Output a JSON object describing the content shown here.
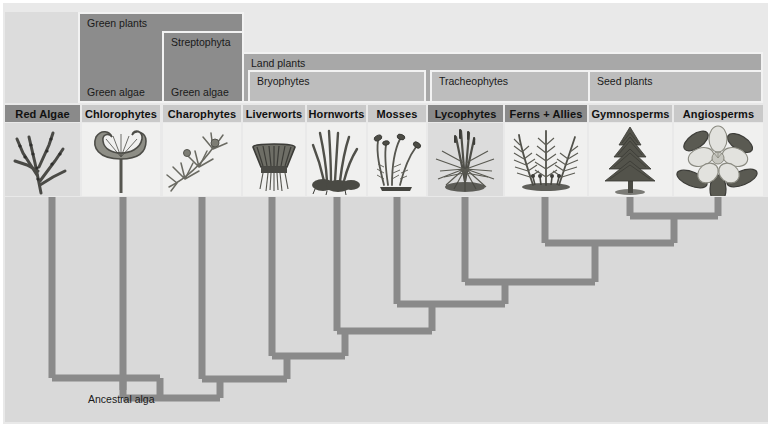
{
  "figure": {
    "type": "cladogram",
    "root_label": "Ancestral alga",
    "colors": {
      "page_background": "#ffffff",
      "panel_background": "#e9e9e9",
      "tree_background": "#d9d9d9",
      "branch": "#8a8a8a",
      "band_dark": "#8c8c8c",
      "band_mid": "#a8a8a8",
      "band_light": "#bdbdbd",
      "name_strip_dark": "#8a8a8a",
      "name_strip_light": "#c9c9c9",
      "text": "#1a1a1a"
    }
  },
  "clade_bands": [
    {
      "id": "green-plants",
      "label": "Green plants",
      "secondary_label": "Green algae",
      "x": 78,
      "y": 12,
      "width": 166,
      "height": 91,
      "shade": "band_dark"
    },
    {
      "id": "streptophyta",
      "label": "Streptophyta",
      "secondary_label": "Green algae",
      "x": 162,
      "y": 31,
      "width": 82,
      "height": 72,
      "shade": "band_dark"
    },
    {
      "id": "land-plants",
      "label": "Land plants",
      "secondary_label": "",
      "x": 242,
      "y": 52,
      "width": 521,
      "height": 51,
      "shade": "band_mid"
    },
    {
      "id": "bryophytes",
      "label": "Bryophytes",
      "secondary_label": "",
      "x": 248,
      "y": 70,
      "width": 178,
      "height": 33,
      "shade": "band_light"
    },
    {
      "id": "tracheophytes",
      "label": "Tracheophytes",
      "secondary_label": "",
      "x": 430,
      "y": 70,
      "width": 333,
      "height": 33,
      "shade": "band_light"
    },
    {
      "id": "seed-plants",
      "label": "Seed plants",
      "secondary_label": "",
      "x": 588,
      "y": 70,
      "width": 175,
      "height": 33,
      "shade": "band_light"
    }
  ],
  "taxa": [
    {
      "id": "red-algae",
      "label": "Red Algae",
      "x": 5,
      "width": 75,
      "tip_x": 52,
      "strip": "dark",
      "tint": true,
      "icon": "red-algae-icon"
    },
    {
      "id": "chlorophytes",
      "label": "Chlorophytes",
      "x": 82,
      "width": 78,
      "tip_x": 123,
      "strip": "light",
      "tint": false,
      "icon": "chlorophyte-icon"
    },
    {
      "id": "charophytes",
      "label": "Charophytes",
      "x": 163,
      "width": 78,
      "tip_x": 202,
      "strip": "light",
      "tint": false,
      "icon": "charophyte-icon"
    },
    {
      "id": "liverworts",
      "label": "Liverworts",
      "x": 243,
      "width": 62,
      "tip_x": 272,
      "strip": "light",
      "tint": false,
      "icon": "liverwort-icon"
    },
    {
      "id": "hornworts",
      "label": "Hornworts",
      "x": 307,
      "width": 59,
      "tip_x": 337,
      "strip": "light",
      "tint": false,
      "icon": "hornwort-icon"
    },
    {
      "id": "mosses",
      "label": "Mosses",
      "x": 368,
      "width": 58,
      "tip_x": 397,
      "strip": "light",
      "tint": false,
      "icon": "moss-icon"
    },
    {
      "id": "lycophytes",
      "label": "Lycophytes",
      "x": 428,
      "width": 75,
      "tip_x": 465,
      "strip": "dark",
      "tint": true,
      "icon": "lycophyte-icon"
    },
    {
      "id": "ferns-allies",
      "label": "Ferns + Allies",
      "x": 505,
      "width": 82,
      "tip_x": 545,
      "strip": "dark",
      "tint": false,
      "icon": "fern-icon"
    },
    {
      "id": "gymnosperms",
      "label": "Gymnosperms",
      "x": 589,
      "width": 83,
      "tip_x": 630,
      "strip": "light",
      "tint": false,
      "icon": "conifer-icon"
    },
    {
      "id": "angiosperms",
      "label": "Angiosperms",
      "x": 674,
      "width": 89,
      "tip_x": 718,
      "strip": "light",
      "tint": false,
      "icon": "flower-icon"
    }
  ],
  "tree_nodes": [
    {
      "id": "node-gymno-angio",
      "children": [
        "gymnosperms",
        "angiosperms"
      ],
      "join_y": 216,
      "stem_x": 674
    },
    {
      "id": "node-seed-ferns",
      "children": [
        "ferns-allies",
        "node-gymno-angio"
      ],
      "join_y": 243,
      "stem_x": 595
    },
    {
      "id": "node-tracheophytes",
      "children": [
        "lycophytes",
        "node-seed-ferns"
      ],
      "join_y": 282,
      "stem_x": 505
    },
    {
      "id": "node-mosses-tracheo",
      "children": [
        "mosses",
        "node-tracheophytes"
      ],
      "join_y": 304,
      "stem_x": 432
    },
    {
      "id": "node-hornworts",
      "children": [
        "hornworts",
        "node-mosses-tracheo"
      ],
      "join_y": 331,
      "stem_x": 345
    },
    {
      "id": "node-liverworts",
      "children": [
        "liverworts",
        "node-hornworts"
      ],
      "join_y": 356,
      "stem_x": 287
    },
    {
      "id": "node-charophytes",
      "children": [
        "charophytes",
        "node-liverworts"
      ],
      "join_y": 379,
      "stem_x": 220
    },
    {
      "id": "node-chlorophytes",
      "children": [
        "chlorophytes",
        "node-charophytes"
      ],
      "join_y": 398,
      "stem_x": 160
    },
    {
      "id": "node-root",
      "children": [
        "red-algae",
        "node-chlorophytes"
      ],
      "join_y": 378,
      "stem_x": 123
    }
  ]
}
